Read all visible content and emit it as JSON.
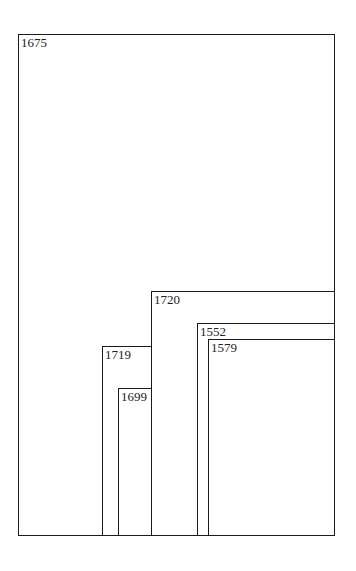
{
  "diagram": {
    "type": "nested-rectangles",
    "line_color": "#1a1a1a",
    "text_color": "#222222",
    "boxes": [
      {
        "id": "b1675",
        "label": "1675",
        "x": 18,
        "y": 34,
        "w": 317,
        "h": 502
      },
      {
        "id": "b1720",
        "label": "1720",
        "x": 151,
        "y": 291,
        "w": 184,
        "h": 245
      },
      {
        "id": "b1552",
        "label": "1552",
        "x": 197,
        "y": 323,
        "w": 138,
        "h": 213
      },
      {
        "id": "b1579",
        "label": "1579",
        "x": 208,
        "y": 339,
        "w": 127,
        "h": 197
      },
      {
        "id": "b1719",
        "label": "1719",
        "x": 102,
        "y": 346,
        "w": 50,
        "h": 190
      },
      {
        "id": "b1699",
        "label": "1699",
        "x": 118,
        "y": 388,
        "w": 34,
        "h": 148
      }
    ]
  }
}
